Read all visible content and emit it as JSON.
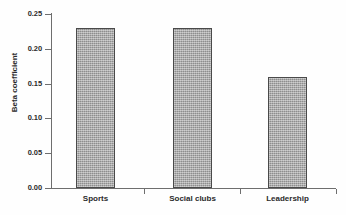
{
  "chart_data": {
    "type": "bar",
    "title": "",
    "xlabel": "",
    "ylabel": "Beta coefficient",
    "categories": [
      "Sports",
      "Social clubs",
      "Leadership"
    ],
    "values": [
      0.23,
      0.23,
      0.16
    ],
    "ylim": [
      0.0,
      0.25
    ],
    "ytick_labels": [
      "0.00",
      "0.05",
      "0.10",
      "0.15",
      "0.20",
      "0.25"
    ],
    "ytick_values": [
      0.0,
      0.05,
      0.1,
      0.15,
      0.2,
      0.25
    ],
    "grid": false,
    "legend": null,
    "series": [
      {
        "name": "Beta coefficient",
        "values": [
          0.23,
          0.23,
          0.16
        ]
      }
    ],
    "colors": {
      "bar_fill": "#a2a2a2",
      "bar_border": "#4a4a4a",
      "axis": "#6e6e6e",
      "text": "#2b2b2b",
      "background": "#fefefe"
    }
  },
  "axes": {
    "y_title": "Beta coefficient",
    "ticks": [
      {
        "label": "0.25",
        "value": 0.25
      },
      {
        "label": "0.20",
        "value": 0.2
      },
      {
        "label": "0.15",
        "value": 0.15
      },
      {
        "label": "0.10",
        "value": 0.1
      },
      {
        "label": "0.05",
        "value": 0.05
      },
      {
        "label": "0.00",
        "value": 0.0
      }
    ]
  },
  "bars": [
    {
      "label": "Sports",
      "value": 0.23
    },
    {
      "label": "Social clubs",
      "value": 0.23
    },
    {
      "label": "Leadership",
      "value": 0.16
    }
  ]
}
